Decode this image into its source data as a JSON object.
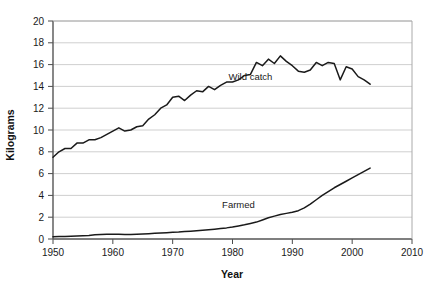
{
  "chart_data": {
    "type": "line",
    "title": "",
    "xlabel": "Year",
    "ylabel": "Kilograms",
    "xlim": [
      1950,
      2010
    ],
    "ylim": [
      0,
      20
    ],
    "xticks": [
      1950,
      1960,
      1970,
      1980,
      1990,
      2000,
      2010
    ],
    "xtick_labels": [
      "1950",
      "1960",
      "1970",
      "1980",
      "1990",
      "2000",
      "2010"
    ],
    "yticks": [
      0,
      2,
      4,
      6,
      8,
      10,
      12,
      14,
      16,
      18,
      20
    ],
    "ytick_labels": [
      "0",
      "2",
      "4",
      "6",
      "8",
      "10",
      "12",
      "14",
      "16",
      "18",
      "20"
    ],
    "grid": "horizontal",
    "grid_color": "#c9c9c9",
    "line_color": "#1a1a1a",
    "legend_position": "inline-annotation",
    "series": [
      {
        "name": "Wild catch",
        "label_x": 1983,
        "label_y": 14.6,
        "x": [
          1950,
          1951,
          1952,
          1953,
          1954,
          1955,
          1956,
          1957,
          1958,
          1959,
          1960,
          1961,
          1962,
          1963,
          1964,
          1965,
          1966,
          1967,
          1968,
          1969,
          1970,
          1971,
          1972,
          1973,
          1974,
          1975,
          1976,
          1977,
          1978,
          1979,
          1980,
          1981,
          1982,
          1983,
          1984,
          1985,
          1986,
          1987,
          1988,
          1989,
          1990,
          1991,
          1992,
          1993,
          1994,
          1995,
          1996,
          1997,
          1998,
          1999,
          2000,
          2001,
          2002,
          2003
        ],
        "values": [
          7.5,
          8.0,
          8.3,
          8.3,
          8.8,
          8.8,
          9.1,
          9.1,
          9.3,
          9.6,
          9.9,
          10.2,
          9.9,
          10.0,
          10.3,
          10.4,
          11.0,
          11.4,
          12.0,
          12.3,
          13.0,
          13.1,
          12.7,
          13.2,
          13.6,
          13.5,
          14.0,
          13.7,
          14.1,
          14.4,
          14.4,
          14.6,
          15.0,
          15.1,
          16.2,
          15.9,
          16.5,
          16.1,
          16.8,
          16.3,
          15.9,
          15.4,
          15.3,
          15.5,
          16.2,
          15.9,
          16.2,
          16.1,
          14.6,
          15.8,
          15.6,
          14.9,
          14.6,
          14.2
        ]
      },
      {
        "name": "Farmed",
        "label_x": 1981,
        "label_y": 2.8,
        "x": [
          1950,
          1951,
          1952,
          1953,
          1954,
          1955,
          1956,
          1957,
          1958,
          1959,
          1960,
          1961,
          1962,
          1963,
          1964,
          1965,
          1966,
          1967,
          1968,
          1969,
          1970,
          1971,
          1972,
          1973,
          1974,
          1975,
          1976,
          1977,
          1978,
          1979,
          1980,
          1981,
          1982,
          1983,
          1984,
          1985,
          1986,
          1987,
          1988,
          1989,
          1990,
          1991,
          1992,
          1993,
          1994,
          1995,
          1996,
          1997,
          1998,
          1999,
          2000,
          2001,
          2002,
          2003
        ],
        "values": [
          0.2,
          0.22,
          0.24,
          0.26,
          0.28,
          0.3,
          0.33,
          0.4,
          0.42,
          0.43,
          0.44,
          0.43,
          0.42,
          0.42,
          0.43,
          0.45,
          0.48,
          0.52,
          0.55,
          0.58,
          0.62,
          0.64,
          0.68,
          0.72,
          0.76,
          0.8,
          0.85,
          0.9,
          0.96,
          1.02,
          1.1,
          1.2,
          1.3,
          1.42,
          1.55,
          1.75,
          1.95,
          2.1,
          2.25,
          2.35,
          2.45,
          2.6,
          2.85,
          3.2,
          3.6,
          4.0,
          4.35,
          4.7,
          5.0,
          5.3,
          5.6,
          5.9,
          6.2,
          6.5
        ]
      }
    ]
  },
  "labels": {
    "ylabel": "Kilograms",
    "xlabel": "Year",
    "series_wild": "Wild catch",
    "series_farmed": "Farmed"
  }
}
